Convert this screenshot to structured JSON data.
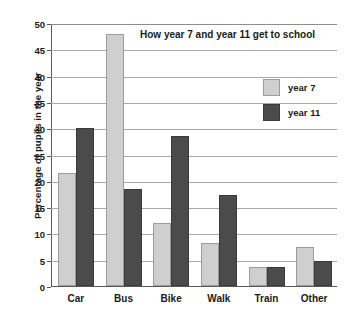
{
  "chart_data": {
    "type": "bar",
    "title": "How year 7 and year 11 get to school",
    "xlabel": "",
    "ylabel": "Percentage of pupils in the year",
    "categories": [
      "Car",
      "Bus",
      "Bike",
      "Walk",
      "Train",
      "Other"
    ],
    "series": [
      {
        "name": "year 7",
        "color": "#cfcfcf",
        "values": [
          21.5,
          48.0,
          12.0,
          8.2,
          3.6,
          7.4
        ]
      },
      {
        "name": "year 11",
        "color": "#4b4b4b",
        "values": [
          30.0,
          18.5,
          28.5,
          17.3,
          3.6,
          4.8
        ]
      }
    ],
    "ylim": [
      0,
      50
    ],
    "yticks": [
      0,
      5,
      10,
      15,
      20,
      25,
      30,
      35,
      40,
      45,
      50
    ],
    "ytick_labels": [
      "0",
      "5",
      "10",
      "15",
      "20",
      "25",
      "30",
      "35",
      "40",
      "45",
      "50"
    ],
    "grid": true,
    "legend_position": "upper-right"
  }
}
